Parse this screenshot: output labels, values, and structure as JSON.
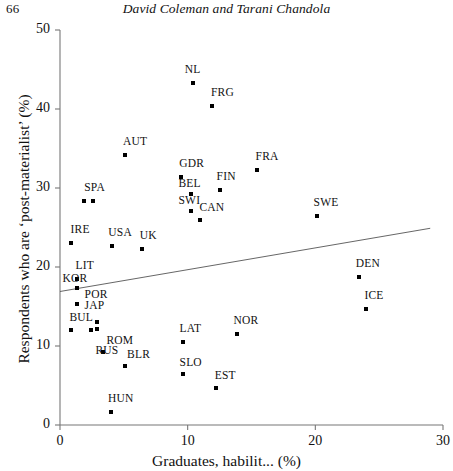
{
  "running_head": {
    "page_number": "66",
    "title": "David Coleman and Tarani Chandola"
  },
  "chart_data": {
    "type": "scatter",
    "title": "",
    "xlabel": "Graduates, habilit... (%)",
    "ylabel": "Respondents who are ‘post-materialist’ (%)",
    "xlim": [
      0,
      30
    ],
    "ylim": [
      0,
      50
    ],
    "xticks": [
      0,
      10,
      20,
      30
    ],
    "yticks": [
      0,
      10,
      20,
      30,
      40,
      50
    ],
    "grid": false,
    "legend": "none",
    "marker": "square",
    "marker_color": "#000000",
    "trendline": {
      "present": true,
      "x_start": 0,
      "y_start": 16.9,
      "x_end": 29.0,
      "y_end": 24.9,
      "color": "#555555"
    },
    "points": [
      {
        "label": "NL",
        "x": 10.4,
        "y": 43.3,
        "label_dx": -8,
        "label_dy": -14
      },
      {
        "label": "FRG",
        "x": 11.9,
        "y": 40.4,
        "label_dx": -1,
        "label_dy": -14
      },
      {
        "label": "AUT",
        "x": 5.1,
        "y": 34.2,
        "label_dx": -2,
        "label_dy": -14
      },
      {
        "label": "FRA",
        "x": 15.4,
        "y": 32.3,
        "label_dx": -1,
        "label_dy": -14
      },
      {
        "label": "GDR",
        "x": 9.5,
        "y": 31.4,
        "label_dx": -2,
        "label_dy": -14
      },
      {
        "label": "FIN",
        "x": 12.5,
        "y": 29.8,
        "label_dx": -3,
        "label_dy": -14
      },
      {
        "label": "BEL",
        "x": 10.3,
        "y": 29.2,
        "label_dx": -13,
        "label_dy": -11
      },
      {
        "label": "SWI",
        "x": 10.3,
        "y": 27.1,
        "label_dx": -13,
        "label_dy": -11
      },
      {
        "label": "SPA",
        "x": 1.9,
        "y": 28.3,
        "label_dx": 0,
        "label_dy": -14
      },
      {
        "label": "",
        "x": 2.6,
        "y": 28.3,
        "label_dx": 0,
        "label_dy": 0
      },
      {
        "label": "SWE",
        "x": 20.1,
        "y": 26.5,
        "label_dx": -3,
        "label_dy": -14
      },
      {
        "label": "CAN",
        "x": 11.0,
        "y": 25.9,
        "label_dx": -1,
        "label_dy": -13
      },
      {
        "label": "IRE",
        "x": 0.9,
        "y": 23.1,
        "label_dx": -1,
        "label_dy": -14
      },
      {
        "label": "USA",
        "x": 4.1,
        "y": 22.6,
        "label_dx": -4,
        "label_dy": -14
      },
      {
        "label": "UK",
        "x": 6.4,
        "y": 22.3,
        "label_dx": -2,
        "label_dy": -14
      },
      {
        "label": "DEN",
        "x": 23.4,
        "y": 18.7,
        "label_dx": -3,
        "label_dy": -14
      },
      {
        "label": "LIT",
        "x": 1.3,
        "y": 18.5,
        "label_dx": -1,
        "label_dy": -14
      },
      {
        "label": "KOR",
        "x": 1.3,
        "y": 17.3,
        "label_dx": -14,
        "label_dy": -10
      },
      {
        "label": "ICE",
        "x": 24.0,
        "y": 14.7,
        "label_dx": -2,
        "label_dy": -14
      },
      {
        "label": "POR",
        "x": 1.3,
        "y": 15.3,
        "label_dx": 8,
        "label_dy": -10
      },
      {
        "label": "JAP",
        "x": 1.3,
        "y": 15.3,
        "label_dx": 8,
        "label_dy": 1
      },
      {
        "label": "NOR",
        "x": 13.9,
        "y": 11.5,
        "label_dx": -4,
        "label_dy": -14
      },
      {
        "label": "BUL",
        "x": 0.9,
        "y": 12.0,
        "label_dx": -2,
        "label_dy": -13
      },
      {
        "label": "",
        "x": 2.4,
        "y": 12.0,
        "label_dx": 0,
        "label_dy": 0
      },
      {
        "label": "",
        "x": 2.9,
        "y": 12.2,
        "label_dx": 0,
        "label_dy": 0
      },
      {
        "label": "",
        "x": 2.9,
        "y": 13.1,
        "label_dx": 0,
        "label_dy": 0
      },
      {
        "label": "LAT",
        "x": 9.6,
        "y": 10.5,
        "label_dx": -3,
        "label_dy": -14
      },
      {
        "label": "ROM",
        "x": 3.4,
        "y": 9.3,
        "label_dx": 3,
        "label_dy": -12
      },
      {
        "label": "RUS",
        "x": 3.4,
        "y": 9.3,
        "label_dx": -8,
        "label_dy": -2
      },
      {
        "label": "SLO",
        "x": 9.6,
        "y": 6.5,
        "label_dx": -3,
        "label_dy": -12
      },
      {
        "label": "BLR",
        "x": 5.1,
        "y": 7.5,
        "label_dx": 2,
        "label_dy": -12
      },
      {
        "label": "EST",
        "x": 12.2,
        "y": 4.7,
        "label_dx": -1,
        "label_dy": -13
      },
      {
        "label": "HUN",
        "x": 4.0,
        "y": 1.6,
        "label_dx": -3,
        "label_dy": -14
      }
    ]
  }
}
